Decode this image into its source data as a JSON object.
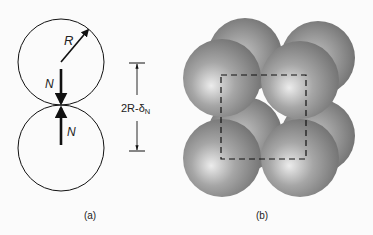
{
  "panel_a": {
    "label": "(a)",
    "radius_label": "R",
    "force_top_label": "N",
    "force_bottom_label": "N",
    "distance_label_main": "2R-δ",
    "distance_label_sub": "N"
  },
  "panel_b": {
    "label": "(b)"
  },
  "colors": {
    "line": "#111111",
    "sphere_dark": "#6e6e6e",
    "sphere_light": "#e6e6e6",
    "background": "#fbfbfb"
  }
}
